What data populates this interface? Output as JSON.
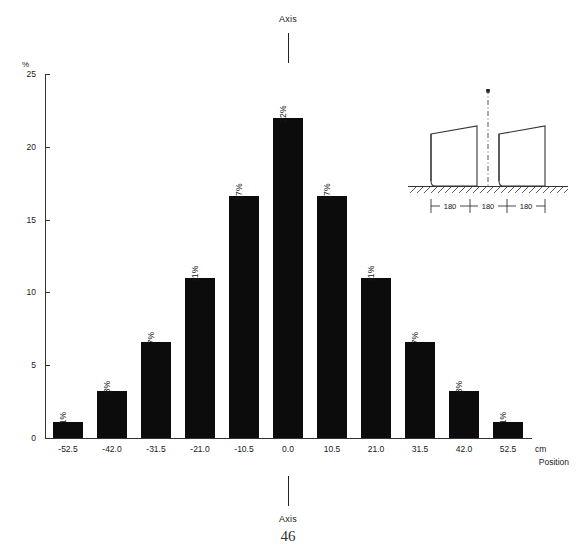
{
  "annotations": {
    "axis_top_label": "Axis",
    "axis_bottom_label": "Axis",
    "page_number": "46"
  },
  "inset": {
    "name": "stall-dimension-diagram",
    "dimensions": [
      "180",
      "180",
      "180"
    ],
    "centerline_style": "dash-dot",
    "ground_hatching": true,
    "stall_count": 2
  },
  "chart_data": {
    "type": "bar",
    "title": "",
    "subtitle": "",
    "xlabel": "Position",
    "xunit": "cm",
    "ylabel": "%",
    "ylim": [
      0,
      25
    ],
    "yticks": [
      0,
      5,
      10,
      15,
      20,
      25
    ],
    "ytick_labels": [
      "0",
      "5",
      "10",
      "15",
      "20",
      "25"
    ],
    "grid": false,
    "legend": "none",
    "bar_color": "#0c0c0c",
    "categories": [
      "-52.5",
      "-42.0",
      "-31.5",
      "-21.0",
      "-10.5",
      "0.0",
      "10.5",
      "21.0",
      "31.5",
      "42.0",
      "52.5"
    ],
    "x": [
      -52.5,
      -42.0,
      -31.5,
      -21.0,
      -10.5,
      0.0,
      10.5,
      21.0,
      31.5,
      42.0,
      52.5
    ],
    "values": [
      1.1,
      3.2,
      6.6,
      11.0,
      16.6,
      22.0,
      16.6,
      11.0,
      6.6,
      3.2,
      1.1
    ],
    "data_labels": [
      "1%",
      "3%",
      "7%",
      "11%",
      "17%",
      "22%",
      "17%",
      "11%",
      "7%",
      "3%",
      "1%"
    ]
  }
}
